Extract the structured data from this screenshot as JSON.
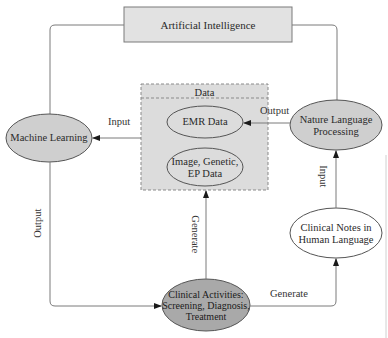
{
  "colors": {
    "line": "#7a7a7a",
    "ai_box_fill": "#e2e2e2",
    "data_box_fill": "#dcdcdc",
    "ellipse_fill_gray": "#cfcfcf",
    "ellipse_fill_dark": "#a9a9a9",
    "ellipse_fill_white": "#ffffff"
  },
  "nodes": {
    "ai": "Artificial Intelligence",
    "data_header": "Data",
    "emr": "EMR Data",
    "image_line1": "Image, Genetic,",
    "image_line2": "EP Data",
    "ml": "Machine Learning",
    "nlp_line1": "Nature Language",
    "nlp_line2": "Processing",
    "notes_line1": "Clinical Notes in",
    "notes_line2": "Human Language",
    "clinical_line1": "Clinical Activities:",
    "clinical_line2": "Screening, Diagnosis,",
    "clinical_line3": "Treatment"
  },
  "edges": {
    "data_to_ml": "Input",
    "nlp_to_emr": "Output",
    "ml_to_clinical": "Output",
    "clinical_to_data": "Generate",
    "clinical_to_notes": "Generate",
    "notes_to_nlp": "Input"
  }
}
